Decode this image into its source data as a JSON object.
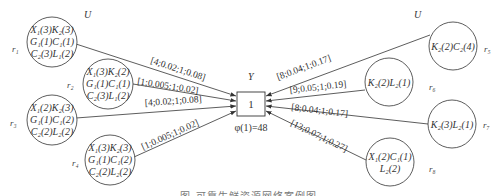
{
  "diagram": {
    "left_group_label": "U",
    "right_group_label": "U",
    "center": {
      "top_label": "Y",
      "node_value": "1",
      "bottom_label": "φ(1)=48"
    },
    "left_nodes": [
      {
        "id": "r1",
        "label": "r₁",
        "lines": [
          "X₁(3)K₂(3)",
          "G₁(1)C₁(1)",
          "C₂(3)L₁(2)"
        ],
        "edge": "[4;0.02;1;0.08]"
      },
      {
        "id": "r2",
        "label": "r₂",
        "lines": [
          "X₁(3)K₂(2)",
          "G₁(1)C₁(1)",
          "C₂(3)L₁(2)"
        ],
        "edge": "[1;0.005;1;0.02]"
      },
      {
        "id": "r3",
        "label": "r₃",
        "lines": [
          "X₁(2)K₂(3)",
          "G₁(1)C₁(2)",
          "C₂(2)L₂(2)"
        ],
        "edge": "[4;0.02;1;0.08]"
      },
      {
        "id": "r4",
        "label": "r₄",
        "lines": [
          "X₁(3)K₂(3)",
          "G₁(1)C₁(2)",
          "C₂(2)L₂(2)"
        ],
        "edge": "[1;0.005;1;0.02]"
      }
    ],
    "right_nodes": [
      {
        "id": "r5",
        "label": "r₅",
        "lines": [
          "K₂(2)C₂(4)"
        ],
        "edge": "[8;0.04;1;0.17]"
      },
      {
        "id": "r6",
        "label": "r₆",
        "lines": [
          "K₂(2)L₂(1)"
        ],
        "edge": "[9;0.05;1;0.19]"
      },
      {
        "id": "r7",
        "label": "r₇",
        "lines": [
          "K₂(3)L₂(1)"
        ],
        "edge": "[8;0.04;1;0.17]"
      },
      {
        "id": "r8",
        "label": "r₈",
        "lines": [
          "X₁(2)C₁(1)",
          "L₂(2)"
        ],
        "edge": "[13;0.07;1;0.27]"
      }
    ],
    "caption": "图  可靠生鲜资源网络案例图"
  },
  "colors": {
    "stroke": "#333333",
    "text": "#333333",
    "caption": "#777777"
  }
}
